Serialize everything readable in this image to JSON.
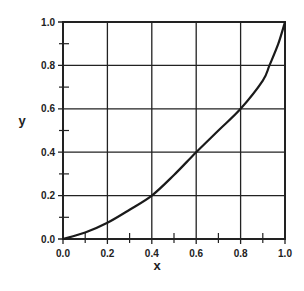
{
  "chart_data": {
    "type": "line",
    "title": "",
    "xlabel": "x",
    "ylabel": "y",
    "xlim": [
      0.0,
      1.0
    ],
    "ylim": [
      0.0,
      1.0
    ],
    "grid": true,
    "legend": null,
    "x_ticks": [
      "0.0",
      "0.2",
      "0.4",
      "0.6",
      "0.8",
      "1.0"
    ],
    "y_ticks": [
      "0.0",
      "0.2",
      "0.4",
      "0.6",
      "0.8",
      "1.0"
    ],
    "x_minor_ticks": [
      0.1,
      0.3,
      0.5,
      0.7,
      0.9
    ],
    "y_minor_ticks": [
      0.1,
      0.3,
      0.5,
      0.7,
      0.9
    ],
    "series": [
      {
        "name": "curve",
        "x": [
          0.0,
          0.1,
          0.2,
          0.3,
          0.4,
          0.5,
          0.6,
          0.7,
          0.8,
          0.9,
          0.93,
          0.97,
          1.0
        ],
        "y": [
          0.0,
          0.03,
          0.075,
          0.135,
          0.2,
          0.295,
          0.4,
          0.5,
          0.6,
          0.73,
          0.8,
          0.9,
          1.0
        ]
      }
    ],
    "colors": {
      "line": "#1a1a1a",
      "grid": "#222222",
      "background": "#ffffff"
    }
  }
}
